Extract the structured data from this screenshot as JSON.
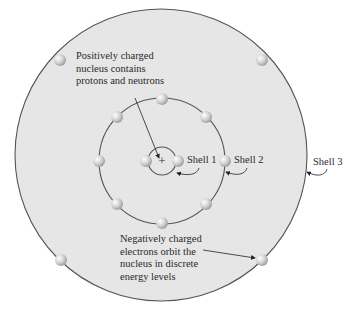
{
  "diagram": {
    "labels": {
      "nucleus_note": [
        "Positively charged",
        "nucleus contains",
        "protons and neutrons"
      ],
      "electron_note": [
        "Negatively charged",
        "electrons orbit the",
        "nucleus in discrete",
        "energy levels"
      ],
      "nucleus_symbol": "+",
      "shell_1": "Shell 1",
      "shell_2": "Shell 2",
      "shell_3": "Shell 3"
    },
    "shells": [
      {
        "name": "Shell 1",
        "radius": 14,
        "electrons": 2
      },
      {
        "name": "Shell 2",
        "radius": 66,
        "electrons": 8
      },
      {
        "name": "Shell 3",
        "radius": 146,
        "electrons": 4
      }
    ],
    "colors": {
      "atom_fill": "#e6e6e6",
      "shell_stroke": "#555555",
      "electron": "#c8c8c8",
      "text": "#2a2a2a"
    }
  }
}
